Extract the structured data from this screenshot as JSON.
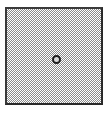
{
  "panel": {
    "pattern": "checkerboard-dither",
    "fill_color": "#8a8a8a",
    "border_color": "#3a3a3a"
  },
  "marker": {
    "icon": "circle-marker-icon",
    "color": "#1e1e1e"
  }
}
